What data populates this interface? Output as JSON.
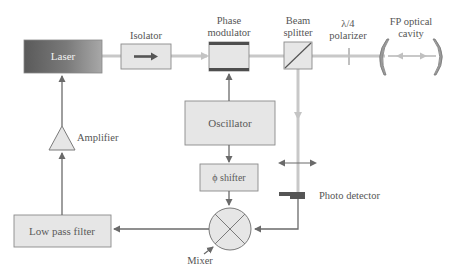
{
  "diagram": {
    "type": "Pound-Drever-Hall laser locking setup",
    "colors": {
      "box_fill": "#e6e6e6",
      "box_stroke": "#8a8a8a",
      "laser_dark": "#555555",
      "laser_light": "#9a9a9a",
      "beam": "#c8c8c8",
      "signal_line": "#777777",
      "modulator_band": "#555555",
      "text": "#555555"
    },
    "nodes": {
      "laser": {
        "label": "Laser"
      },
      "isolator": {
        "label": "Isolator"
      },
      "phase_modulator": {
        "label_line1": "Phase",
        "label_line2": "modulator"
      },
      "beam_splitter": {
        "label_line1": "Beam",
        "label_line2": "splitter"
      },
      "polarizer": {
        "label_line1": "λ/4",
        "label_line2": "polarizer"
      },
      "fp_cavity": {
        "label_line1": "FP optical",
        "label_line2": "cavity"
      },
      "oscillator": {
        "label": "Oscillator"
      },
      "phi_shifter": {
        "label": "ϕ shifter"
      },
      "mixer": {
        "label": "Mixer"
      },
      "low_pass_filter": {
        "label": "Low pass filter"
      },
      "amplifier": {
        "label": "Amplifier"
      },
      "photo_detector": {
        "label": "Photo detector"
      }
    },
    "edges": [
      {
        "from": "laser",
        "to": "isolator",
        "kind": "optical"
      },
      {
        "from": "isolator",
        "to": "phase_modulator",
        "kind": "optical"
      },
      {
        "from": "phase_modulator",
        "to": "beam_splitter",
        "kind": "optical"
      },
      {
        "from": "beam_splitter",
        "to": "polarizer",
        "kind": "optical"
      },
      {
        "from": "polarizer",
        "to": "fp_cavity",
        "kind": "optical"
      },
      {
        "from": "beam_splitter",
        "to": "photo_detector",
        "kind": "optical"
      },
      {
        "from": "oscillator",
        "to": "phase_modulator",
        "kind": "electrical"
      },
      {
        "from": "oscillator",
        "to": "phi_shifter",
        "kind": "electrical"
      },
      {
        "from": "phi_shifter",
        "to": "mixer",
        "kind": "electrical"
      },
      {
        "from": "photo_detector",
        "to": "mixer",
        "kind": "electrical"
      },
      {
        "from": "mixer",
        "to": "low_pass_filter",
        "kind": "electrical"
      },
      {
        "from": "low_pass_filter",
        "to": "amplifier",
        "kind": "electrical"
      },
      {
        "from": "amplifier",
        "to": "laser",
        "kind": "electrical"
      }
    ]
  }
}
